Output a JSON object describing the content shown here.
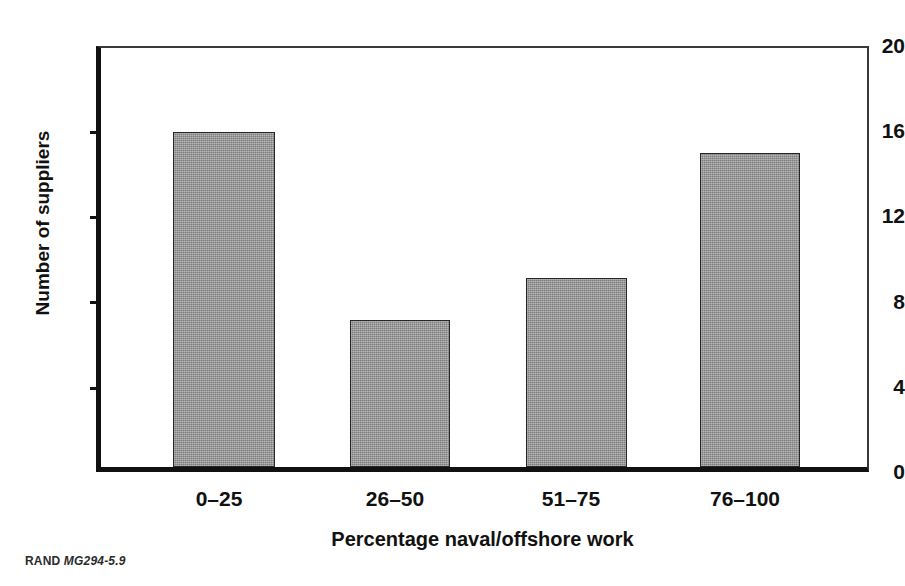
{
  "chart_data": {
    "type": "bar",
    "title": "",
    "subtitle": "",
    "categories": [
      "0–25",
      "26–50",
      "51–75",
      "76–100"
    ],
    "values": [
      16,
      7,
      9,
      15
    ],
    "series": [
      {
        "name": "Number of suppliers",
        "values": [
          16,
          7,
          9,
          15
        ]
      }
    ],
    "xlabel": "Percentage naval/offshore work",
    "ylabel": "Number of suppliers",
    "ylim": [
      0,
      20
    ],
    "y_ticks": [
      0,
      4,
      8,
      12,
      16,
      20
    ],
    "y_tick_labels": [
      "0",
      "4",
      "8",
      "12",
      "16",
      "20"
    ],
    "grid": false,
    "legend": false,
    "legend_position": "none",
    "bar_fill_color": "#9a9a9a",
    "bar_edge_color": "#262626",
    "axis_color": "#111111",
    "background_color": "#ffffff"
  },
  "figure": {
    "credit_org": "RAND",
    "credit_id": "MG294-5.9"
  }
}
